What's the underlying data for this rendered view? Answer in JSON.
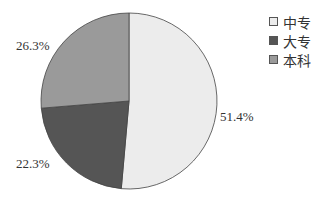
{
  "chart_data": {
    "type": "pie",
    "title": "",
    "categories": [
      "中专",
      "大专",
      "本科"
    ],
    "values": [
      51.4,
      22.3,
      26.3
    ],
    "labels": [
      "51.4%",
      "22.3%",
      "26.3%"
    ],
    "colors": [
      "#ececec",
      "#555555",
      "#9a9a9a"
    ],
    "start_angle": "12 o'clock",
    "direction": "clockwise",
    "legend_position": "top-right"
  },
  "legend": [
    {
      "label": "中专",
      "color": "#ececec"
    },
    {
      "label": "大专",
      "color": "#555555"
    },
    {
      "label": "本科",
      "color": "#9a9a9a"
    }
  ]
}
